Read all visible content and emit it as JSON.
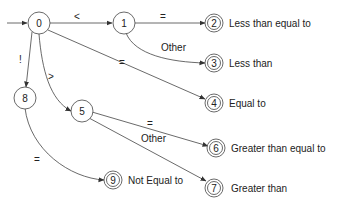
{
  "diagram": {
    "nodes": [
      {
        "id": "0",
        "label": "0",
        "accepting": false
      },
      {
        "id": "1",
        "label": "1",
        "accepting": false
      },
      {
        "id": "2",
        "label": "2",
        "accepting": true,
        "description": "Less than equal to"
      },
      {
        "id": "3",
        "label": "3",
        "accepting": true,
        "description": "Less than"
      },
      {
        "id": "4",
        "label": "4",
        "accepting": true,
        "description": "Equal to"
      },
      {
        "id": "5",
        "label": "5",
        "accepting": false
      },
      {
        "id": "6",
        "label": "6",
        "accepting": true,
        "description": "Greater than equal to"
      },
      {
        "id": "7",
        "label": "7",
        "accepting": true,
        "description": "Greater than"
      },
      {
        "id": "8",
        "label": "8",
        "accepting": false
      },
      {
        "id": "9",
        "label": "9",
        "accepting": true,
        "description": "Not Equal to"
      }
    ],
    "edges": [
      {
        "from": "start",
        "to": "0",
        "label": ""
      },
      {
        "from": "0",
        "to": "1",
        "label": "<"
      },
      {
        "from": "1",
        "to": "2",
        "label": "="
      },
      {
        "from": "1",
        "to": "3",
        "label": "Other"
      },
      {
        "from": "0",
        "to": "4",
        "label": "="
      },
      {
        "from": "0",
        "to": "8",
        "label": "!"
      },
      {
        "from": "0",
        "to": "5",
        "label": ">"
      },
      {
        "from": "5",
        "to": "6",
        "label": "="
      },
      {
        "from": "5",
        "to": "7",
        "label": "Other"
      },
      {
        "from": "8",
        "to": "9",
        "label": "="
      }
    ]
  }
}
